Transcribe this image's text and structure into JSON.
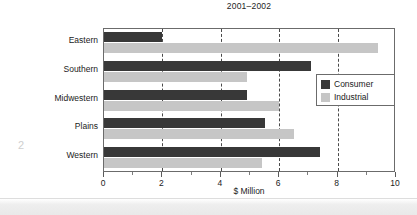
{
  "page": {
    "page_number": "2"
  },
  "chart_data": {
    "type": "bar",
    "orientation": "horizontal",
    "title": "2001–2002",
    "xlabel": "$ Million",
    "ylabel": "",
    "xlim": [
      0,
      10
    ],
    "xticks": [
      0,
      2,
      4,
      6,
      8,
      10
    ],
    "xtick_labels": [
      "0",
      "2",
      "4",
      "6",
      "8",
      "10"
    ],
    "minor_xticks": [
      1,
      3,
      5,
      7,
      9
    ],
    "gridlines": [
      2,
      4,
      6,
      8
    ],
    "grid": true,
    "grid_style": "dashed",
    "legend_position": "right-middle",
    "categories": [
      "Eastern",
      "Southern",
      "Midwestern",
      "Plains",
      "Western"
    ],
    "series": [
      {
        "name": "Consumer",
        "color": "#383838",
        "values": [
          2.0,
          7.1,
          4.9,
          5.5,
          7.4
        ]
      },
      {
        "name": "Industrial",
        "color": "#c6c6c6",
        "values": [
          9.4,
          4.9,
          6.0,
          6.5,
          5.4
        ]
      }
    ]
  }
}
